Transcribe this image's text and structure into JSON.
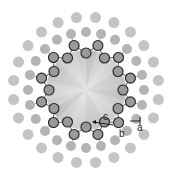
{
  "diagram": {
    "center": [
      86,
      90
    ],
    "core_disk": {
      "radius": 40,
      "fill": "#c8c8c8",
      "highlight": "#ebebeb"
    },
    "inner_ring": {
      "count": 24,
      "r_inner": 37,
      "r_outer": 46,
      "atom_radius": 5,
      "fill": "#9a9a9a",
      "stroke": "#222222"
    },
    "outer_ring_1": {
      "count": 24,
      "radius": 58,
      "atom_radius": 5,
      "fill": "#b4b4b4"
    },
    "outer_ring_2": {
      "count": 24,
      "radius": 73,
      "atom_radius": 5.5,
      "fill": "#c4c4c4"
    },
    "labels": {
      "a": "a",
      "b": "b",
      "c": "c"
    }
  }
}
